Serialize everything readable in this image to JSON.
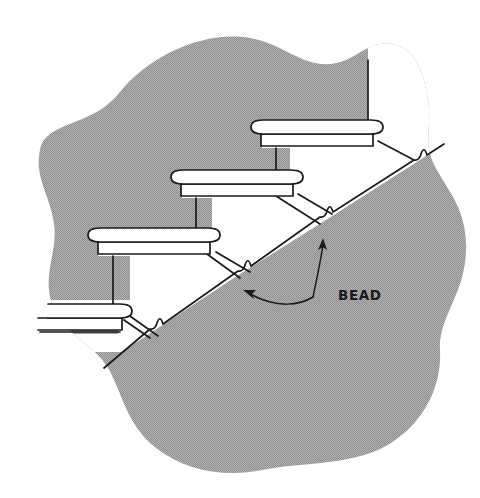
{
  "figure": {
    "kind": "technical-line-drawing",
    "background_color": "#ffffff",
    "wall_fill_color": "#a8a8a8",
    "wall_fill_pattern": "fine halftone dither",
    "line_color": "#1a1a1a",
    "tread_fill_color": "#ffffff"
  },
  "annotations": {
    "bead_label": "BEAD",
    "bead_label_x": 338,
    "bead_label_y": 300,
    "leader_junction": {
      "x": 312,
      "y": 295
    },
    "arrow_targets": [
      {
        "name": "upper-bead",
        "x": 322,
        "y": 240
      },
      {
        "name": "lower-bead",
        "x": 243,
        "y": 290
      }
    ]
  },
  "beads": [
    {
      "index": 1,
      "x": 421,
      "y": 158
    },
    {
      "index": 2,
      "x": 327,
      "y": 218
    },
    {
      "index": 3,
      "x": 245,
      "y": 272
    },
    {
      "index": 4,
      "x": 157,
      "y": 330
    }
  ],
  "stairs": [
    {
      "index": 1,
      "name": "top-step",
      "nosing_label": "bullnose-nosing"
    },
    {
      "index": 2,
      "name": "middle-step",
      "nosing_label": "bullnose-nosing"
    },
    {
      "index": 3,
      "name": "lower-step",
      "nosing_label": "bullnose-nosing"
    },
    {
      "index": 4,
      "name": "bottom-partial-step",
      "nosing_label": "bullnose-nosing"
    }
  ]
}
